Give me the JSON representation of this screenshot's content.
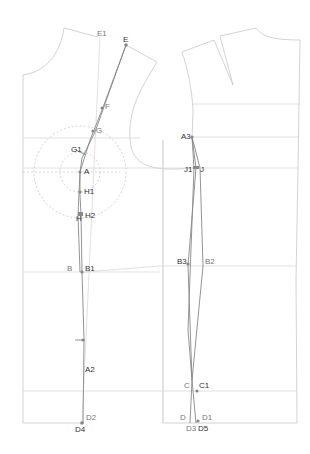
{
  "diagram": {
    "type": "garment-pattern-draft",
    "colors": {
      "outline": "#c8c8c8",
      "construction": "#d8d8d8",
      "seam": "#888888",
      "point": "#888888",
      "dashed": "#c0c0c0",
      "label_dark": "#333333",
      "label_light": "#777777"
    },
    "front_piece_labels": {
      "E1": "E1",
      "E": "E",
      "F": "F",
      "G": "G",
      "G1": "G1",
      "A": "A",
      "H1": "H1",
      "H": "H",
      "H2": "H2",
      "B": "B",
      "B1": "B1",
      "A2": "A2",
      "D2": "D2",
      "D4": "D4"
    },
    "back_piece_labels": {
      "A3": "A3",
      "J1": "J1",
      "J": "J",
      "B3": "B3",
      "B2": "B2",
      "C": "C",
      "C1": "C1",
      "D": "D",
      "D1": "D1",
      "D3": "D3",
      "D5": "D5"
    }
  }
}
